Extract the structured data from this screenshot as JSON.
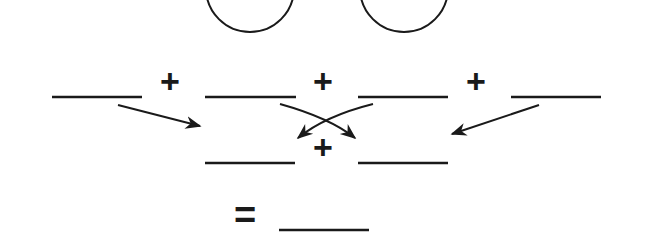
{
  "diagram": {
    "stroke_color": "#1a1a1a",
    "circles": [
      {
        "cx": 250,
        "cy": -12,
        "r": 44
      },
      {
        "cx": 404,
        "cy": -12,
        "r": 44
      }
    ],
    "row1": {
      "blanks": [
        {
          "x1": 52,
          "x2": 142,
          "y": 97
        },
        {
          "x1": 205,
          "x2": 296,
          "y": 97
        },
        {
          "x1": 358,
          "x2": 448,
          "y": 97
        },
        {
          "x1": 511,
          "x2": 601,
          "y": 97
        }
      ],
      "plus_signs": [
        "+",
        "+",
        "+"
      ]
    },
    "row2": {
      "blanks": [
        {
          "x1": 205,
          "x2": 295,
          "y": 163
        },
        {
          "x1": 358,
          "x2": 448,
          "y": 163
        }
      ],
      "plus_sign": "+"
    },
    "result": {
      "equals_sign": "=",
      "blank": {
        "x1": 279,
        "x2": 369,
        "y": 230
      }
    }
  }
}
